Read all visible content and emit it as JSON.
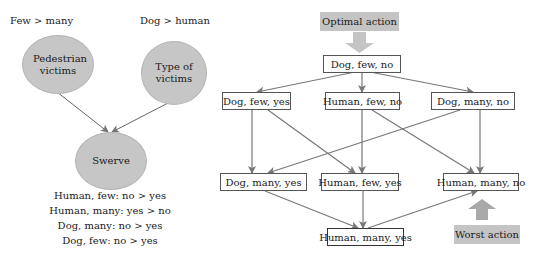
{
  "left_diagram": {
    "criteria": [
      {
        "preference": "Few > many",
        "node": "Pedestrian victims"
      },
      {
        "preference": "Dog > human",
        "node": "Type of victims"
      }
    ],
    "decision_node": "Swerve",
    "rules": [
      "Human, few: no > yes",
      "Human, many: yes > no",
      "Dog, many: no > yes",
      "Dog, few: no > yes"
    ]
  },
  "right_diagram": {
    "optimal_label": "Optimal action",
    "worst_label": "Worst action",
    "top": "Dog, few, no",
    "row2": [
      "Dog, few, yes",
      "Human, few, no",
      "Dog, many, no"
    ],
    "row3": [
      "Dog, many, yes",
      "Human, few, yes",
      "Human, many, no"
    ],
    "bottom": "Human, many, yes"
  },
  "colors": {
    "ellipse_fill": "#c6c6c6",
    "tag_fill": "#c4c4c4",
    "arrow": "#777777",
    "box_border": "#555555"
  }
}
